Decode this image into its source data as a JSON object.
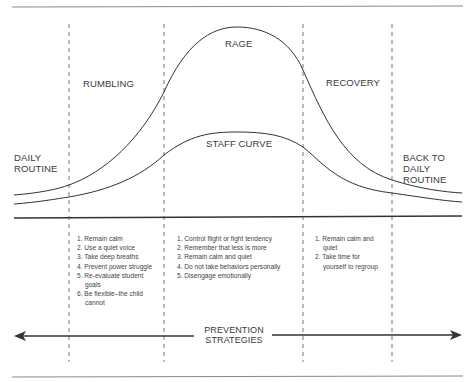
{
  "diagram": {
    "phases": [
      {
        "id": "daily-routine",
        "label": "DAILY\nROUTINE",
        "lines": [
          "DAILY",
          "ROUTINE"
        ]
      },
      {
        "id": "rumbling",
        "label": "RUMBLING"
      },
      {
        "id": "rage",
        "label": "RAGE"
      },
      {
        "id": "recovery",
        "label": "RECOVERY"
      },
      {
        "id": "back-to-daily-routine",
        "lines": [
          "BACK TO",
          "DAILY",
          "ROUTINE"
        ]
      }
    ],
    "curves": {
      "rage_label": "RAGE",
      "staff_label": "STAFF CURVE"
    },
    "strategies": {
      "rumbling": [
        "1. Remain calm",
        "2. Use a quiet voice",
        "3. Take deep breaths",
        "4. Prevent power struggle",
        "5. Re-evaluate student goals",
        "6. Be flexible–the child cannot"
      ],
      "rage": [
        "1. Control flight or fight tendency",
        "2. Remember that less is more",
        "3. Remain calm and quiet",
        "4. Do not take behaviors personally",
        "5. Disengage emotionally"
      ],
      "recovery": [
        "1. Remain calm and quiet",
        "2. Take time for yourself to regroup"
      ]
    },
    "prevention": {
      "line1": "PREVENTION",
      "line2": "STRATEGIES"
    },
    "colors": {
      "line": "#333333",
      "dash": "#555555",
      "text": "#3a3a3a"
    }
  }
}
